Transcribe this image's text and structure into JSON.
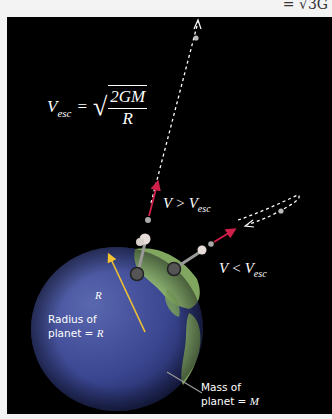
{
  "top_fragment": "= √3G",
  "formula": {
    "lhs_var": "V",
    "lhs_sub": "esc",
    "equals": "=",
    "numerator": "2GM",
    "denominator": "R"
  },
  "labels": {
    "escape": {
      "var": "V",
      "op": ">",
      "rhs_var": "V",
      "rhs_sub": "esc"
    },
    "orbit": {
      "var": "V",
      "op": "<",
      "rhs_var": "V",
      "rhs_sub": "esc"
    },
    "radius_symbol": "R",
    "radius_caption_line1": "Radius of",
    "radius_caption_line2": "planet =",
    "radius_caption_var": "R",
    "mass_caption_line1": "Mass of",
    "mass_caption_line2": "planet =",
    "mass_caption_var": "M"
  },
  "colors": {
    "background": "#000000",
    "planet_ocean": "#3c4a92",
    "planet_land": "#8fb86a",
    "velocity_arrow": "#d0204a",
    "radius_arrow": "#f2c230",
    "trajectory": "#ffffff"
  }
}
